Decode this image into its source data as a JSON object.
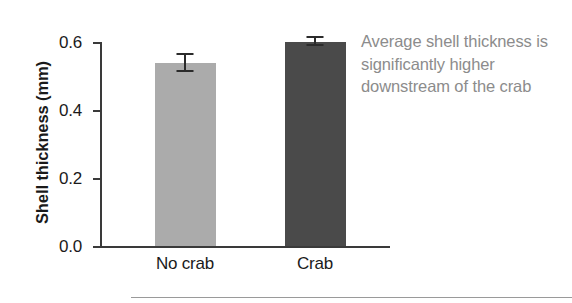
{
  "chart_data": {
    "type": "bar",
    "title": "",
    "xlabel": "",
    "ylabel": "Shell thickness (mm)",
    "categories": [
      "No crab",
      "Crab"
    ],
    "values": [
      0.537,
      0.6
    ],
    "errors": [
      0.024,
      0.013
    ],
    "series": [
      {
        "name": "Shell thickness",
        "values": [
          0.537,
          0.6
        ]
      }
    ],
    "ylim": [
      0.0,
      0.6
    ],
    "yticks": [
      "0.0",
      "0.2",
      "0.4",
      "0.6"
    ],
    "ytick_values": [
      0.0,
      0.2,
      0.4,
      0.6
    ],
    "grid": false,
    "legend": "none",
    "bar_colors": [
      "#ababab",
      "#4a4a4a"
    ],
    "annotation": "Average shell thickness is significantly higher downstream of the crab"
  },
  "axes": {
    "y_title": "Shell thickness (mm)",
    "ticks": [
      {
        "label": "0.6",
        "value": 0.6
      },
      {
        "label": "0.4",
        "value": 0.4
      },
      {
        "label": "0.2",
        "value": 0.2
      },
      {
        "label": "0.0",
        "value": 0.0
      }
    ]
  },
  "bars": [
    {
      "label": "No crab",
      "value": 0.537,
      "error": 0.024,
      "color": "#ababab"
    },
    {
      "label": "Crab",
      "value": 0.6,
      "error": 0.013,
      "color": "#4a4a4a"
    }
  ],
  "annotation": {
    "text": "Average shell thickness is significantly higher downstream of the crab",
    "color": "#8c8c8c"
  }
}
